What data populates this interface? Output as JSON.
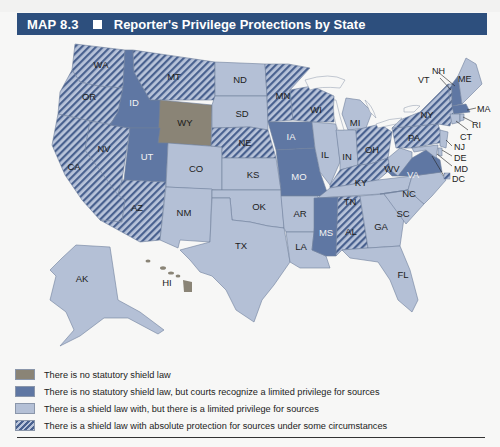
{
  "header": {
    "map_number": "MAP 8.3",
    "title": "Reporter's Privilege Protections by State"
  },
  "colors": {
    "header_bg": "#2d4f7d",
    "no_law": "#8a8476",
    "no_law_courts_privilege": "#5f77a3",
    "limited_privilege": "#b4c0d6",
    "absolute_hatch_base": "#b9c4da",
    "absolute_hatch_stripe": "#49618f"
  },
  "legend": {
    "items": [
      {
        "key": "no_law",
        "label": "There is no statutory shield law"
      },
      {
        "key": "no_law_courts_privilege",
        "label": "There is no statutory shield law, but courts recognize a limited privilege for sources"
      },
      {
        "key": "limited_privilege",
        "label": "There is a shield law with, but there is a limited privilege for sources"
      },
      {
        "key": "absolute",
        "label": "There is a shield law with absolute protection for sources under some circumstances"
      }
    ]
  },
  "states": {
    "no_law": [
      "WY"
    ],
    "no_law_courts_privilege": [
      "ID",
      "UT",
      "IA",
      "MO",
      "MS",
      "VA",
      "NH",
      "MA"
    ],
    "limited_privilege": [
      "ND",
      "SD",
      "CO",
      "KS",
      "NM",
      "OK",
      "TX",
      "AR",
      "LA",
      "IL",
      "IN",
      "MI",
      "TN",
      "GA",
      "SC",
      "NC",
      "FL",
      "WV",
      "AK",
      "HI",
      "ME",
      "VT",
      "CT",
      "RI",
      "NJ",
      "DE",
      "MD"
    ],
    "absolute": [
      "WA",
      "OR",
      "CA",
      "NV",
      "AZ",
      "MT",
      "NE",
      "MN",
      "WI",
      "OH",
      "KY",
      "AL",
      "PA",
      "NY",
      "DC"
    ]
  },
  "labels": {
    "WA": "WA",
    "OR": "OR",
    "CA": "CA",
    "NV": "NV",
    "ID": "ID",
    "MT": "MT",
    "WY": "WY",
    "UT": "UT",
    "AZ": "AZ",
    "CO": "CO",
    "NM": "NM",
    "ND": "ND",
    "SD": "SD",
    "NE": "NE",
    "KS": "KS",
    "OK": "OK",
    "TX": "TX",
    "MN": "MN",
    "IA": "IA",
    "MO": "MO",
    "AR": "AR",
    "LA": "LA",
    "WI": "WI",
    "IL": "IL",
    "MI": "MI",
    "IN": "IN",
    "OH": "OH",
    "KY": "KY",
    "TN": "TN",
    "MS": "MS",
    "AL": "AL",
    "GA": "GA",
    "FL": "FL",
    "SC": "SC",
    "NC": "NC",
    "VA": "VA",
    "WV": "WV",
    "PA": "PA",
    "NY": "NY",
    "VT": "VT",
    "NH": "NH",
    "ME": "ME",
    "MA": "MA",
    "RI": "RI",
    "CT": "CT",
    "NJ": "NJ",
    "DE": "DE",
    "MD": "MD",
    "DC": "DC",
    "AK": "AK",
    "HI": "HI"
  }
}
